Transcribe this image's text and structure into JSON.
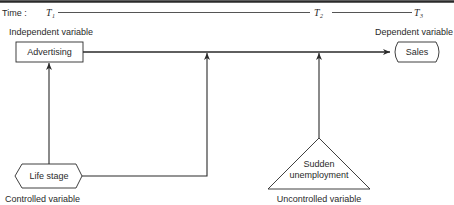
{
  "timeline": {
    "label": "Time :",
    "points": [
      {
        "symbol": "T",
        "subscript": "1"
      },
      {
        "symbol": "T",
        "subscript": "2"
      },
      {
        "symbol": "T",
        "subscript": "3"
      }
    ]
  },
  "nodes": {
    "independent": {
      "category": "Independent variable",
      "name": "Advertising"
    },
    "dependent": {
      "category": "Dependent variable",
      "name": "Sales"
    },
    "controlled": {
      "category": "Controlled variable",
      "name": "Life stage"
    },
    "uncontrolled": {
      "category": "Uncontrolled variable",
      "name_line1": "Sudden",
      "name_line2": "unemployment"
    }
  }
}
